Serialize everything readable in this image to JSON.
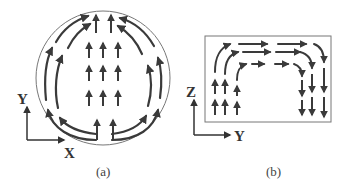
{
  "figure": {
    "panels": [
      {
        "id": "a",
        "caption": "(a)",
        "shape": "circle",
        "axes": {
          "vertical": "Y",
          "horizontal": "X"
        },
        "flow": "upward core flow with curved return streamlines along the circular boundary"
      },
      {
        "id": "b",
        "caption": "(b)",
        "shape": "rectangle",
        "axes": {
          "vertical": "Z",
          "horizontal": "Y"
        },
        "flow": "upward on the left, horizontal across the top, downward on the right"
      }
    ],
    "colors": {
      "arrow": "#3a3a3a",
      "outline": "#777777",
      "text": "#333333"
    }
  }
}
